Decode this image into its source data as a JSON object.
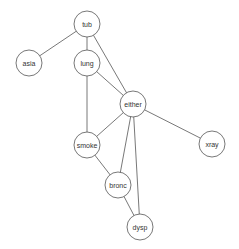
{
  "diagram": {
    "type": "undirected-graph",
    "node_radius": 13,
    "colors": {
      "stroke": "#555555",
      "fill": "#ffffff",
      "text": "#333333",
      "background": "#ffffff"
    },
    "nodes": [
      {
        "id": "tub",
        "label": "tub",
        "x": 87,
        "y": 24
      },
      {
        "id": "asia",
        "label": "asia",
        "x": 29,
        "y": 63
      },
      {
        "id": "lung",
        "label": "lung",
        "x": 87,
        "y": 63
      },
      {
        "id": "either",
        "label": "either",
        "x": 133,
        "y": 104
      },
      {
        "id": "xray",
        "label": "xray",
        "x": 212,
        "y": 144
      },
      {
        "id": "smoke",
        "label": "smoke",
        "x": 87,
        "y": 145
      },
      {
        "id": "bronc",
        "label": "bronc",
        "x": 118,
        "y": 185
      },
      {
        "id": "dysp",
        "label": "dysp",
        "x": 140,
        "y": 227
      }
    ],
    "edges": [
      [
        "tub",
        "asia"
      ],
      [
        "tub",
        "lung"
      ],
      [
        "tub",
        "either"
      ],
      [
        "lung",
        "either"
      ],
      [
        "lung",
        "smoke"
      ],
      [
        "either",
        "smoke"
      ],
      [
        "either",
        "bronc"
      ],
      [
        "either",
        "dysp"
      ],
      [
        "either",
        "xray"
      ],
      [
        "smoke",
        "bronc"
      ],
      [
        "bronc",
        "dysp"
      ]
    ]
  }
}
